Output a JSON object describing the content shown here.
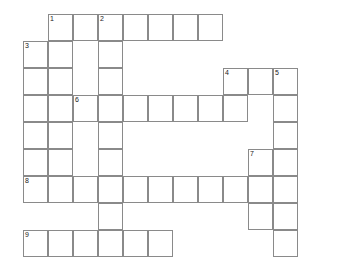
{
  "puzzle": {
    "title": "Crossword Puzzle Grid",
    "grid": {
      "origin_x": 23,
      "origin_y": 14,
      "cell_width": 25,
      "cell_height": 27,
      "columns": 12,
      "rows": 9,
      "border_color": "#8a8a8a",
      "cell_fill": "#ffffff",
      "background": "#ffffff",
      "number_color": "#1a1a1a"
    },
    "clue_numbers": [
      "1",
      "2",
      "3",
      "4",
      "5",
      "6",
      "7",
      "8",
      "9"
    ],
    "entries": [
      {
        "number": "1",
        "direction": "across",
        "row": 0,
        "col": 1,
        "length": 7
      },
      {
        "number": "1",
        "direction": "down",
        "row": 0,
        "col": 1,
        "length": 7
      },
      {
        "number": "2",
        "direction": "down",
        "row": 0,
        "col": 3,
        "length": 9
      },
      {
        "number": "3",
        "direction": "down",
        "row": 1,
        "col": 0,
        "length": 6
      },
      {
        "number": "4",
        "direction": "down",
        "row": 2,
        "col": 8,
        "length": 2
      },
      {
        "number": "4",
        "direction": "across",
        "row": 2,
        "col": 8,
        "length": 3
      },
      {
        "number": "5",
        "direction": "down",
        "row": 2,
        "col": 10,
        "length": 7
      },
      {
        "number": "6",
        "direction": "across",
        "row": 3,
        "col": 2,
        "length": 7
      },
      {
        "number": "7",
        "direction": "down",
        "row": 5,
        "col": 9,
        "length": 3
      },
      {
        "number": "8",
        "direction": "across",
        "row": 6,
        "col": 0,
        "length": 11
      },
      {
        "number": "9",
        "direction": "across",
        "row": 8,
        "col": 0,
        "length": 6
      }
    ],
    "cells": [
      {
        "row": 0,
        "col": 1,
        "number": "1",
        "letter": ""
      },
      {
        "row": 0,
        "col": 2,
        "number": "",
        "letter": ""
      },
      {
        "row": 0,
        "col": 3,
        "number": "2",
        "letter": ""
      },
      {
        "row": 0,
        "col": 4,
        "number": "",
        "letter": ""
      },
      {
        "row": 0,
        "col": 5,
        "number": "",
        "letter": ""
      },
      {
        "row": 0,
        "col": 6,
        "number": "",
        "letter": ""
      },
      {
        "row": 0,
        "col": 7,
        "number": "",
        "letter": ""
      },
      {
        "row": 1,
        "col": 0,
        "number": "3",
        "letter": ""
      },
      {
        "row": 1,
        "col": 1,
        "number": "",
        "letter": ""
      },
      {
        "row": 1,
        "col": 3,
        "number": "",
        "letter": ""
      },
      {
        "row": 2,
        "col": 0,
        "number": "",
        "letter": ""
      },
      {
        "row": 2,
        "col": 1,
        "number": "",
        "letter": ""
      },
      {
        "row": 2,
        "col": 3,
        "number": "",
        "letter": ""
      },
      {
        "row": 2,
        "col": 8,
        "number": "4",
        "letter": ""
      },
      {
        "row": 2,
        "col": 9,
        "number": "",
        "letter": ""
      },
      {
        "row": 2,
        "col": 10,
        "number": "5",
        "letter": ""
      },
      {
        "row": 3,
        "col": 0,
        "number": "",
        "letter": ""
      },
      {
        "row": 3,
        "col": 1,
        "number": "",
        "letter": ""
      },
      {
        "row": 3,
        "col": 2,
        "number": "6",
        "letter": ""
      },
      {
        "row": 3,
        "col": 3,
        "number": "",
        "letter": ""
      },
      {
        "row": 3,
        "col": 4,
        "number": "",
        "letter": ""
      },
      {
        "row": 3,
        "col": 5,
        "number": "",
        "letter": ""
      },
      {
        "row": 3,
        "col": 6,
        "number": "",
        "letter": ""
      },
      {
        "row": 3,
        "col": 7,
        "number": "",
        "letter": ""
      },
      {
        "row": 3,
        "col": 8,
        "number": "",
        "letter": ""
      },
      {
        "row": 3,
        "col": 10,
        "number": "",
        "letter": ""
      },
      {
        "row": 4,
        "col": 0,
        "number": "",
        "letter": ""
      },
      {
        "row": 4,
        "col": 1,
        "number": "",
        "letter": ""
      },
      {
        "row": 4,
        "col": 3,
        "number": "",
        "letter": ""
      },
      {
        "row": 4,
        "col": 10,
        "number": "",
        "letter": ""
      },
      {
        "row": 5,
        "col": 0,
        "number": "",
        "letter": ""
      },
      {
        "row": 5,
        "col": 1,
        "number": "",
        "letter": ""
      },
      {
        "row": 5,
        "col": 3,
        "number": "",
        "letter": ""
      },
      {
        "row": 5,
        "col": 9,
        "number": "7",
        "letter": ""
      },
      {
        "row": 5,
        "col": 10,
        "number": "",
        "letter": ""
      },
      {
        "row": 6,
        "col": 0,
        "number": "8",
        "letter": ""
      },
      {
        "row": 6,
        "col": 1,
        "number": "",
        "letter": ""
      },
      {
        "row": 6,
        "col": 2,
        "number": "",
        "letter": ""
      },
      {
        "row": 6,
        "col": 3,
        "number": "",
        "letter": ""
      },
      {
        "row": 6,
        "col": 4,
        "number": "",
        "letter": ""
      },
      {
        "row": 6,
        "col": 5,
        "number": "",
        "letter": ""
      },
      {
        "row": 6,
        "col": 6,
        "number": "",
        "letter": ""
      },
      {
        "row": 6,
        "col": 7,
        "number": "",
        "letter": ""
      },
      {
        "row": 6,
        "col": 8,
        "number": "",
        "letter": ""
      },
      {
        "row": 6,
        "col": 9,
        "number": "",
        "letter": ""
      },
      {
        "row": 6,
        "col": 10,
        "number": "",
        "letter": ""
      },
      {
        "row": 7,
        "col": 3,
        "number": "",
        "letter": ""
      },
      {
        "row": 7,
        "col": 9,
        "number": "",
        "letter": ""
      },
      {
        "row": 7,
        "col": 10,
        "number": "",
        "letter": ""
      },
      {
        "row": 8,
        "col": 0,
        "number": "9",
        "letter": ""
      },
      {
        "row": 8,
        "col": 1,
        "number": "",
        "letter": ""
      },
      {
        "row": 8,
        "col": 2,
        "number": "",
        "letter": ""
      },
      {
        "row": 8,
        "col": 3,
        "number": "",
        "letter": ""
      },
      {
        "row": 8,
        "col": 4,
        "number": "",
        "letter": ""
      },
      {
        "row": 8,
        "col": 5,
        "number": "",
        "letter": ""
      },
      {
        "row": 8,
        "col": 10,
        "number": "",
        "letter": ""
      }
    ]
  }
}
